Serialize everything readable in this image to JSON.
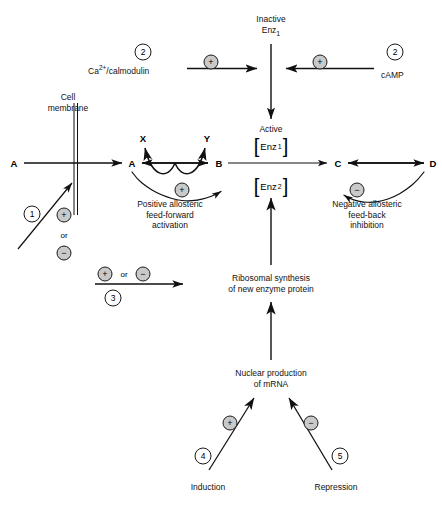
{
  "diagram": {
    "colors": {
      "line": "#111111",
      "badge_fill": "#c9c9c9",
      "badge_stroke": "#1a1a1a",
      "background": "#ffffff"
    }
  },
  "nodes": {
    "substrate_outside": "A",
    "substrate_inside": "A",
    "product_b": "B",
    "product_c": "C",
    "product_d": "D",
    "cofactor_x": "X",
    "cofactor_y": "Y"
  },
  "labels": {
    "cell_membrane": [
      "Cell",
      "membrane"
    ],
    "inactive_enzyme": [
      "Inactive",
      "Enz"
    ],
    "inactive_enzyme_sub": "1",
    "active_enzyme": "Active",
    "enzyme1_bracket": "Enz",
    "enzyme1_sub": "1",
    "enzyme2_bracket": "Enz",
    "enzyme2_sub": "2",
    "calmodulin": "Ca",
    "calmodulin_sup": "2+",
    "calmodulin_rest": "/calmodulin",
    "camp": "cAMP",
    "positive_allosteric": [
      "Positive allosteric",
      "feed-forward",
      "activation"
    ],
    "negative_allosteric": [
      "Negative allosteric",
      "feed-back",
      "inhibition"
    ],
    "ribosomal": [
      "Ribosomal synthesis",
      "of new enzyme protein"
    ],
    "nuclear": [
      "Nuclear production",
      "of mRNA"
    ],
    "induction": "Induction",
    "repression": "Repression",
    "or_membrane": "or",
    "or_transcription": "or"
  },
  "badges": {
    "plus": "+",
    "minus": "−",
    "calmodulin_sign": "+",
    "camp_sign": "+",
    "membrane_plus": "+",
    "membrane_minus": "−",
    "positive_allosteric_sign": "+",
    "negative_allosteric_sign": "−",
    "transcription_plus": "+",
    "transcription_minus": "−",
    "induction_sign": "+",
    "repression_sign": "−"
  },
  "step_numbers": {
    "membrane_transport": "1",
    "calmodulin_step": "2",
    "camp_step": "2",
    "enzyme_synthesis_step": "3",
    "induction_step": "4",
    "repression_step": "5"
  }
}
